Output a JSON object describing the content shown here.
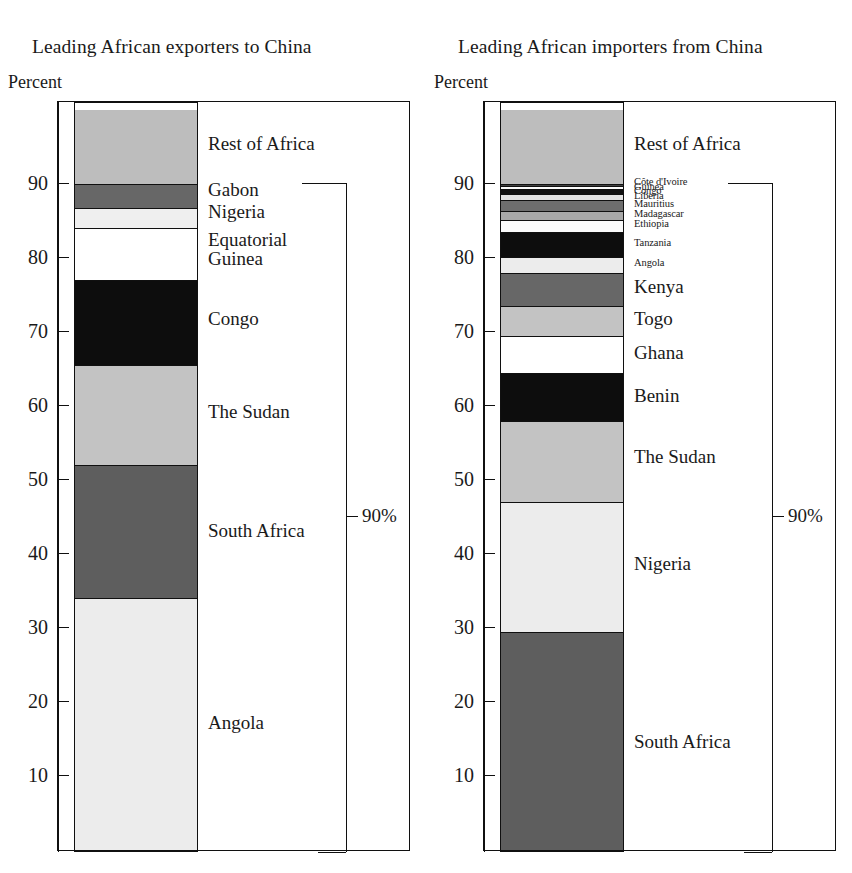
{
  "chart_data": [
    {
      "type": "bar",
      "title": "Leading African exporters to China",
      "ylabel": "Percent",
      "xlabel": "",
      "stacked": true,
      "ylim": [
        0,
        100
      ],
      "yticks": [
        10,
        20,
        30,
        40,
        50,
        60,
        70,
        80,
        90
      ],
      "grid": false,
      "legend": "inline-right",
      "annotation": "90%",
      "annotation_range": [
        0,
        90
      ],
      "categories": [
        "Angola",
        "South Africa",
        "The Sudan",
        "Congo",
        "Equatorial Guinea",
        "Nigeria",
        "Gabon",
        "Rest of Africa"
      ],
      "values": [
        34.0,
        18.0,
        13.5,
        11.5,
        7.0,
        2.8,
        3.2,
        10.0
      ],
      "cumulative_tops": [
        34.0,
        52.0,
        65.5,
        77.0,
        84.0,
        86.8,
        90.0,
        100.0
      ],
      "segments": [
        {
          "label": "Angola",
          "start": 0.0,
          "end": 34.0,
          "fill": "#ececec",
          "label_at": 17.0
        },
        {
          "label": "South Africa",
          "start": 34.0,
          "end": 52.0,
          "fill": "#5e5e5e",
          "label_at": 43.0
        },
        {
          "label": "The Sudan",
          "start": 52.0,
          "end": 65.5,
          "fill": "#c3c3c3",
          "label_at": 59.0
        },
        {
          "label": "Congo",
          "start": 65.5,
          "end": 77.0,
          "fill": "#0d0d0d",
          "label_at": 71.6
        },
        {
          "label": "Equatorial\nGuinea",
          "start": 77.0,
          "end": 84.0,
          "fill": "#ffffff",
          "label_at": 81.0
        },
        {
          "label": "Nigeria",
          "start": 84.0,
          "end": 86.8,
          "fill": "#efefef",
          "label_at": 86.1
        },
        {
          "label": "Gabon",
          "start": 86.8,
          "end": 90.0,
          "fill": "#676767",
          "label_at": 89.1
        },
        {
          "label": "Rest of Africa",
          "start": 90.0,
          "end": 100.0,
          "fill": "#bdbdbd",
          "label_at": 95.3
        }
      ]
    },
    {
      "type": "bar",
      "title": "Leading African importers from China",
      "ylabel": "Percent",
      "xlabel": "",
      "stacked": true,
      "ylim": [
        0,
        100
      ],
      "yticks": [
        10,
        20,
        30,
        40,
        50,
        60,
        70,
        80,
        90
      ],
      "grid": false,
      "legend": "inline-right",
      "annotation": "90%",
      "annotation_range": [
        0,
        90
      ],
      "categories": [
        "South Africa",
        "Nigeria",
        "The Sudan",
        "Benin",
        "Ghana",
        "Togo",
        "Kenya",
        "Angola",
        "Tanzania",
        "Ethiopia",
        "Madagascar",
        "Mauritius",
        "Liberia",
        "Congo",
        "Guinea",
        "Côte d'Ivoire",
        "Rest of Africa"
      ],
      "values": [
        29.5,
        17.5,
        11.0,
        6.5,
        5.0,
        4.0,
        4.5,
        2.2,
        3.3,
        1.6,
        1.2,
        1.5,
        1.1,
        1.1,
        0.5,
        0.5,
        10.0
      ],
      "cumulative_tops": [
        29.5,
        47.0,
        58.0,
        64.5,
        69.5,
        73.5,
        78.0,
        80.2,
        83.5,
        85.1,
        86.3,
        87.8,
        88.9,
        90.0,
        89.5,
        90.0,
        100.0
      ],
      "segments": [
        {
          "label": "South Africa",
          "start": 0.0,
          "end": 29.5,
          "fill": "#5e5e5e",
          "label_at": 14.5,
          "tiny": false
        },
        {
          "label": "Nigeria",
          "start": 29.5,
          "end": 47.0,
          "fill": "#ececec",
          "label_at": 38.5,
          "tiny": false
        },
        {
          "label": "The Sudan",
          "start": 47.0,
          "end": 58.0,
          "fill": "#c3c3c3",
          "label_at": 53.0,
          "tiny": false
        },
        {
          "label": "Benin",
          "start": 58.0,
          "end": 64.5,
          "fill": "#0d0d0d",
          "label_at": 61.2,
          "tiny": false
        },
        {
          "label": "Ghana",
          "start": 64.5,
          "end": 69.5,
          "fill": "#ffffff",
          "label_at": 67.0,
          "tiny": false
        },
        {
          "label": "Togo",
          "start": 69.5,
          "end": 73.5,
          "fill": "#c3c3c3",
          "label_at": 71.6,
          "tiny": false
        },
        {
          "label": "Kenya",
          "start": 73.5,
          "end": 78.0,
          "fill": "#676767",
          "label_at": 75.9,
          "tiny": false
        },
        {
          "label": "Angola",
          "start": 78.0,
          "end": 80.2,
          "fill": "#ececec",
          "label_at": 79.2,
          "tiny": true
        },
        {
          "label": "Tanzania",
          "start": 80.2,
          "end": 83.5,
          "fill": "#0d0d0d",
          "label_at": 81.9,
          "tiny": true
        },
        {
          "label": "Ethiopia",
          "start": 83.5,
          "end": 85.1,
          "fill": "#fbfbfb",
          "label_at": 84.4,
          "tiny": true
        },
        {
          "label": "Madagascar",
          "start": 85.1,
          "end": 86.3,
          "fill": "#a8a8a8",
          "label_at": 85.8,
          "tiny": true
        },
        {
          "label": "Mauritius",
          "start": 86.3,
          "end": 87.8,
          "fill": "#6e6e6e",
          "label_at": 87.1,
          "tiny": true
        },
        {
          "label": "Liberia",
          "start": 87.8,
          "end": 88.6,
          "fill": "#e2e2e2",
          "label_at": 88.2,
          "tiny": true
        },
        {
          "label": "Congo",
          "start": 88.6,
          "end": 89.3,
          "fill": "#111111",
          "label_at": 88.9,
          "tiny": true
        },
        {
          "label": "Guinea",
          "start": 89.3,
          "end": 89.7,
          "fill": "#fbfbfb",
          "label_at": 89.5,
          "tiny": true
        },
        {
          "label": "Côte d'Ivoire",
          "start": 89.7,
          "end": 90.0,
          "fill": "#3f3f3f",
          "label_at": 90.1,
          "tiny": true
        },
        {
          "label": "Rest of Africa",
          "start": 90.0,
          "end": 100.0,
          "fill": "#bdbdbd",
          "label_at": 95.3,
          "tiny": false
        }
      ]
    }
  ]
}
